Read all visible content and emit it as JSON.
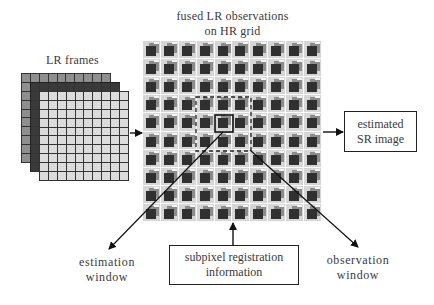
{
  "diagram": {
    "title_line1": "fused LR observations",
    "title_line2": "on HR grid",
    "lr_frames_label": "LR frames",
    "sr_box": {
      "line1": "estimated",
      "line2": "SR image"
    },
    "registration_box": {
      "line1": "subpixel registration",
      "line2": "information"
    },
    "estimation_window": {
      "line1": "estimation",
      "line2": "window"
    },
    "observation_window": {
      "line1": "observation",
      "line2": "window"
    },
    "lr_frames": {
      "count": 3,
      "grid_size": "10x10",
      "colors": [
        "#8f8f8f",
        "#3a3a3a",
        "#dcdcdc"
      ]
    },
    "hr_grid": {
      "rows": 10,
      "cols": 10
    },
    "colors": {
      "line": "#222222",
      "cell_bg": "#d6d6d6",
      "cell_mid": "#8c8c8c",
      "cell_dark": "#303030"
    }
  }
}
